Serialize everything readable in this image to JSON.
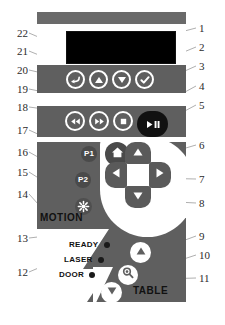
{
  "figure": {
    "type": "control-panel-diagram"
  },
  "panel": {
    "display": {
      "name": "lcd-display",
      "content": ""
    },
    "menu_row": [
      {
        "id": "back",
        "icon": "back-arrow-icon",
        "label": "Back"
      },
      {
        "id": "up",
        "icon": "triangle-up-icon",
        "label": "Up"
      },
      {
        "id": "down",
        "icon": "triangle-down-icon",
        "label": "Down"
      },
      {
        "id": "confirm",
        "icon": "check-icon",
        "label": "Enter"
      }
    ],
    "transport_row": [
      {
        "id": "rewind",
        "icon": "rewind-icon",
        "label": "Rewind"
      },
      {
        "id": "forward",
        "icon": "fast-forward-icon",
        "label": "Forward"
      },
      {
        "id": "stop",
        "icon": "stop-icon",
        "label": "Stop"
      },
      {
        "id": "play-pause",
        "icon": "play-pause-icon",
        "label": "Start / Pause"
      }
    ],
    "preset_buttons": [
      {
        "id": "p1",
        "label": "P1"
      },
      {
        "id": "p2",
        "label": "P2"
      }
    ],
    "light_button": {
      "id": "light",
      "icon": "light-burst-icon",
      "label": "Light"
    },
    "dpad": {
      "up": {
        "icon": "triangle-up-icon",
        "label": "Jog Up"
      },
      "down": {
        "icon": "triangle-down-icon",
        "label": "Jog Down"
      },
      "left": {
        "icon": "triangle-left-icon",
        "label": "Jog Left"
      },
      "right": {
        "icon": "triangle-right-icon",
        "label": "Jog Right"
      },
      "home": {
        "icon": "home-icon",
        "label": "Home"
      }
    },
    "section_labels": {
      "motion": "MOTION",
      "table": "TABLE"
    },
    "status_leds": [
      {
        "id": "ready",
        "label": "READY",
        "color": "#1a1a1a"
      },
      {
        "id": "laser",
        "label": "LASER",
        "color": "#1a1a1a"
      },
      {
        "id": "door",
        "label": "DOOR",
        "color": "#1a1a1a"
      }
    ],
    "table_buttons": [
      {
        "id": "table-up",
        "icon": "triangle-up-icon",
        "label": "Table Up"
      },
      {
        "id": "table-focus",
        "icon": "focus-magnifier-icon",
        "label": "Auto Focus"
      },
      {
        "id": "table-down",
        "icon": "triangle-down-icon",
        "label": "Table Down"
      }
    ]
  },
  "callouts": {
    "left": [
      "22",
      "21",
      "20",
      "19",
      "18",
      "17",
      "16",
      "15",
      "14",
      "13",
      "12"
    ],
    "right": [
      "1",
      "2",
      "3",
      "4",
      "5",
      "6",
      "7",
      "8",
      "9",
      "10",
      "11"
    ]
  },
  "colors": {
    "panel_band": "#5f5f5f",
    "panel_face": "#ffffff",
    "lcd": "#000000",
    "button_solid": "#111111",
    "text": "#111111"
  }
}
